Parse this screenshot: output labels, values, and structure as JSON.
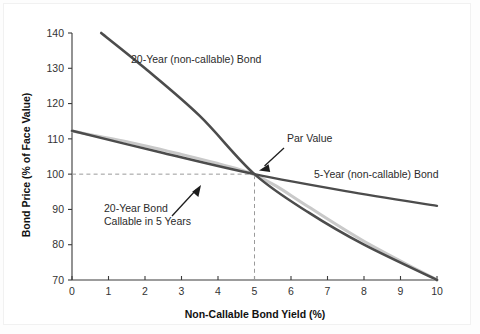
{
  "chart_data": {
    "type": "line",
    "title": "",
    "xlabel": "Non-Callable Bond Yield (%)",
    "ylabel": "Bond Price (% of Face Value)",
    "xlim": [
      0,
      10
    ],
    "ylim": [
      70,
      140
    ],
    "grid": false,
    "legend_position": "inline-labels",
    "xticks": [
      "0",
      "1",
      "2",
      "3",
      "4",
      "5",
      "6",
      "7",
      "8",
      "9",
      "10"
    ],
    "yticks": [
      "70",
      "80",
      "90",
      "100",
      "110",
      "120",
      "130",
      "140"
    ],
    "series": [
      {
        "name": "20-Year (non-callable) Bond",
        "color": "#4c4c4c",
        "style": "solid",
        "x": [
          0.8,
          2.0,
          3.5,
          5.0,
          6.5,
          8.0,
          10.0
        ],
        "values": [
          140.0,
          130.0,
          116.5,
          100.0,
          89.0,
          80.0,
          70.0
        ]
      },
      {
        "name": "5-Year (non-callable) Bond",
        "color": "#4c4c4c",
        "style": "solid",
        "x": [
          0.0,
          2.5,
          5.0,
          7.5,
          10.0
        ],
        "values": [
          112.3,
          106.0,
          100.0,
          95.2,
          91.0
        ]
      },
      {
        "name": "20-Year Bond Callable in 5 Years",
        "color": "#c9c9c9",
        "style": "solid",
        "x": [
          0.0,
          1.5,
          3.0,
          4.0,
          4.6,
          5.0,
          5.6,
          6.5,
          8.0,
          10.0
        ],
        "values": [
          112.2,
          109.2,
          105.6,
          103.0,
          101.3,
          99.8,
          96.6,
          90.6,
          81.0,
          70.0
        ]
      }
    ],
    "annotations": [
      {
        "id": "par-value",
        "text": "Par Value",
        "target_x": 5.0,
        "target_y": 100.0,
        "has_arrow": true
      },
      {
        "id": "callable-note",
        "text": "20-Year Bond\nCallable in 5 Years",
        "line1": "20-Year Bond",
        "line2": "Callable in 5 Years",
        "target_x": 4.35,
        "target_y": 102.2,
        "has_arrow": true
      },
      {
        "id": "label-20y",
        "text": "20-Year (non-callable) Bond",
        "has_arrow": false
      },
      {
        "id": "label-5y",
        "text": "5-Year (non-callable) Bond",
        "has_arrow": false
      }
    ],
    "guides": [
      {
        "id": "par-horizontal",
        "orientation": "horizontal",
        "value": 100,
        "from_x": 0,
        "to_x": 5,
        "style": "dashed"
      },
      {
        "id": "par-vertical",
        "orientation": "vertical",
        "value": 5,
        "from_y": 70,
        "to_y": 100,
        "style": "dashed"
      }
    ],
    "colors": {
      "axis": "#3a3a3a",
      "dark_line": "#4c4c4c",
      "light_line": "#c9c9c9",
      "guide": "#9a9a9a",
      "text": "#222222",
      "background": "#ffffff"
    }
  }
}
